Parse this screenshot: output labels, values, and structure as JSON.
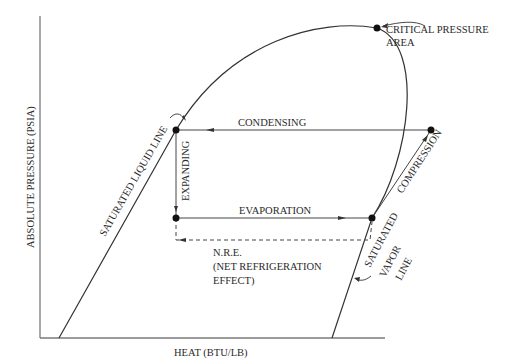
{
  "diagram": {
    "type": "pressure-enthalpy refrigeration cycle",
    "axes": {
      "y_label": "ABSOLUTE PRESSURE (PSIA)",
      "x_label": "HEAT (BTU/LB)"
    },
    "curves": {
      "left": "SATURATED LIQUID LINE",
      "right_line1": "SATURATED",
      "right_line2": "VAPOR",
      "right_line3": "LINE"
    },
    "annotations": {
      "critical_line1": "CRITICAL PRESSURE",
      "critical_line2": "AREA",
      "nre_line1": "N.R.E.",
      "nre_line2": "(NET REFRIGERATION",
      "nre_line3": "EFFECT)"
    },
    "processes": {
      "condensing": "CONDENSING",
      "expanding": "EXPANDING",
      "evaporation": "EVAPORATION",
      "compression": "COMPRESSION"
    },
    "colors": {
      "line": "#333333",
      "axis": "#7a7a7a",
      "background": "#ffffff"
    }
  }
}
